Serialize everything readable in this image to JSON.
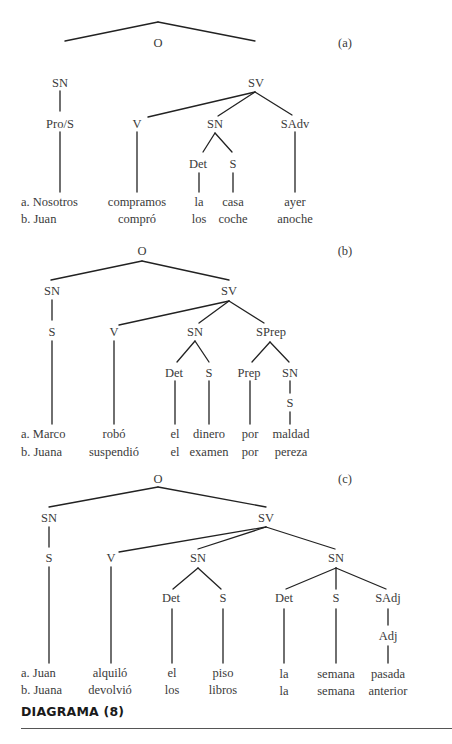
{
  "caption": "DIAGRAMA (8)",
  "trees": {
    "a": {
      "tag": "(a)",
      "nodes": {
        "root": "O",
        "sn": "SN",
        "sv": "SV",
        "pro_s": "Pro/S",
        "v": "V",
        "sn2": "SN",
        "sadv": "SAdv",
        "det": "Det",
        "s": "S"
      },
      "sentences": {
        "a": {
          "subject": "a. Nosotros",
          "verb": "compramos",
          "det": "la",
          "noun": "casa",
          "adv": "ayer"
        },
        "b": {
          "subject": "b. Juan",
          "verb": "compró",
          "det": "los",
          "noun": "coche",
          "adv": "anoche"
        }
      }
    },
    "b": {
      "tag": "(b)",
      "nodes": {
        "root": "O",
        "sn": "SN",
        "sv": "SV",
        "s": "S",
        "v": "V",
        "sn2": "SN",
        "sprep": "SPrep",
        "det": "Det",
        "s2": "S",
        "prep": "Prep",
        "sn3": "SN",
        "s3": "S"
      },
      "sentences": {
        "a": {
          "subject": "a. Marco",
          "verb": "robó",
          "det": "el",
          "noun": "dinero",
          "prep": "por",
          "pnoun": "maldad"
        },
        "b": {
          "subject": "b. Juana",
          "verb": "suspendió",
          "det": "el",
          "noun": "examen",
          "prep": "por",
          "pnoun": "pereza"
        }
      }
    },
    "c": {
      "tag": "(c)",
      "nodes": {
        "root": "O",
        "sn": "SN",
        "sv": "SV",
        "s": "S",
        "v": "V",
        "sn2": "SN",
        "sn3": "SN",
        "det": "Det",
        "s2": "S",
        "det2": "Det",
        "s3": "S",
        "sadj": "SAdj",
        "adj": "Adj"
      },
      "sentences": {
        "a": {
          "subject": "a. Juan",
          "verb": "alquiló",
          "det": "el",
          "noun": "piso",
          "det2": "la",
          "noun2": "semana",
          "adj": "pasada"
        },
        "b": {
          "subject": "b. Juana",
          "verb": "devolvió",
          "det": "los",
          "noun": "libros",
          "det2": "la",
          "noun2": "semana",
          "adj": "anterior"
        }
      }
    }
  }
}
